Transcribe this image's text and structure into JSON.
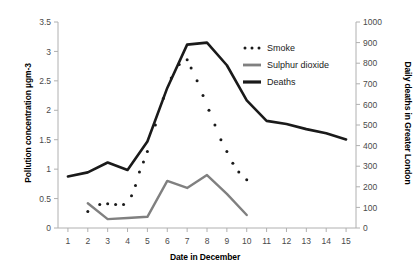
{
  "chart_data": {
    "type": "line",
    "title": "",
    "xlabel": "Date in December",
    "ylabel": "Pollution concentration µgm-3",
    "ylabel_right": "Daily deaths in Greater London",
    "x": [
      1,
      2,
      3,
      4,
      5,
      6,
      7,
      8,
      9,
      10,
      11,
      12,
      13,
      14,
      15
    ],
    "xlim": [
      0.5,
      15.5
    ],
    "xticks": [
      "1",
      "2",
      "3",
      "4",
      "5",
      "6",
      "7",
      "8",
      "9",
      "10",
      "11",
      "12",
      "13",
      "14",
      "15"
    ],
    "ylim": [
      0,
      3.5
    ],
    "yticks": [
      "0",
      "0.5",
      "1",
      "1.5",
      "2",
      "2.5",
      "3",
      "3.5"
    ],
    "ylim_right": [
      0,
      1000
    ],
    "yticks_right": [
      "0",
      "100",
      "200",
      "300",
      "400",
      "500",
      "600",
      "700",
      "800",
      "900",
      "1000"
    ],
    "grid": false,
    "legend_position": "upper-right",
    "series": [
      {
        "name": "Smoke",
        "style": "dotted",
        "color": "#1a1a1a",
        "axis": "left",
        "x": [
          2,
          2.6,
          3,
          3.4,
          3.8,
          4.2,
          4.4,
          4.6,
          4.8,
          5,
          5.4,
          5.8,
          6.2,
          6.6,
          7,
          7.2,
          7.5,
          7.8,
          8.1,
          8.4,
          8.7,
          9,
          9.3,
          9.6,
          10
        ],
        "values": [
          0.28,
          0.4,
          0.41,
          0.4,
          0.4,
          0.55,
          0.72,
          0.95,
          1.12,
          1.3,
          1.75,
          2.2,
          2.55,
          2.78,
          2.86,
          2.72,
          2.5,
          2.25,
          2.0,
          1.75,
          1.5,
          1.3,
          1.1,
          0.95,
          0.82
        ]
      },
      {
        "name": "Sulphur dioxide",
        "style": "solid-thick-gray",
        "color": "#808080",
        "axis": "left",
        "x": [
          2,
          3,
          4,
          5,
          6,
          7,
          8,
          9,
          10
        ],
        "values": [
          0.42,
          0.15,
          0.17,
          0.19,
          0.8,
          0.68,
          0.9,
          0.58,
          0.22
        ]
      },
      {
        "name": "Deaths",
        "style": "solid-thick-black",
        "color": "#1a1a1a",
        "axis": "right",
        "x": [
          1,
          2,
          3,
          4,
          5,
          6,
          7,
          8,
          9,
          10,
          11,
          12,
          13,
          14,
          15
        ],
        "values": [
          250,
          270,
          318,
          282,
          420,
          680,
          890,
          900,
          790,
          620,
          520,
          505,
          480,
          460,
          430
        ]
      }
    ],
    "legend": [
      {
        "label": "Smoke",
        "marker": "dotted",
        "color": "#1a1a1a"
      },
      {
        "label": "Sulphur dioxide",
        "marker": "line-gray",
        "color": "#808080"
      },
      {
        "label": "Deaths",
        "marker": "line-black",
        "color": "#1a1a1a"
      }
    ]
  }
}
